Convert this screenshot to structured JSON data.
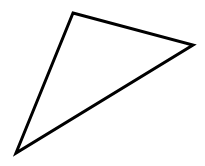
{
  "canvas": {
    "width": 205,
    "height": 166,
    "background": "#ffffff"
  },
  "shape": {
    "type": "triangle",
    "stroke": "#000000",
    "stroke_width": 3,
    "fill": "none",
    "vertices": [
      [
        73,
        13
      ],
      [
        193,
        45
      ],
      [
        16,
        153
      ]
    ]
  }
}
